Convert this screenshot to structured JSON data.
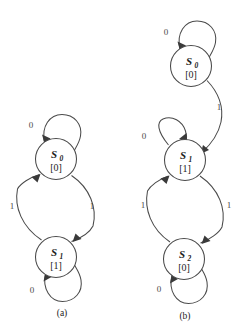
{
  "figure": {
    "type": "state-transition-diagrams",
    "background_color": "#ffffff",
    "line_color": "#4a4a4a",
    "text_color": "#1c1c1c"
  },
  "diagram_a": {
    "caption": "(a)",
    "caption_x": 62,
    "caption_y": 316,
    "states": [
      {
        "id": "a-s0",
        "name": "S",
        "subscript": "0",
        "output": "[0]",
        "cx": 56,
        "cy": 159,
        "r": 20.5
      },
      {
        "id": "a-s1",
        "name": "S",
        "subscript": "1",
        "output": "[1]",
        "cx": 56,
        "cy": 257,
        "r": 20.5
      }
    ],
    "transitions": [
      {
        "id": "a-s0-self",
        "from": "a-s0",
        "to": "a-s0",
        "label": "0",
        "label_x": 31,
        "label_y": 128
      },
      {
        "id": "a-s0-to-s1",
        "from": "a-s0",
        "to": "a-s1",
        "label": "1",
        "label_x": 12,
        "label_y": 209
      },
      {
        "id": "a-s1-to-s0",
        "from": "a-s1",
        "to": "a-s0",
        "label": "1",
        "label_x": 92,
        "label_y": 209
      },
      {
        "id": "a-s1-self",
        "from": "a-s1",
        "to": "a-s1",
        "label": "0",
        "label_x": 32,
        "label_y": 293
      }
    ]
  },
  "diagram_b": {
    "caption": "(b)",
    "caption_x": 185,
    "caption_y": 319,
    "states": [
      {
        "id": "b-s0",
        "name": "S",
        "subscript": "0",
        "output": "[0]",
        "cx": 191,
        "cy": 66,
        "r": 20.5
      },
      {
        "id": "b-s1",
        "name": "S",
        "subscript": "1",
        "output": "[1]",
        "cx": 185,
        "cy": 160,
        "r": 20.5
      },
      {
        "id": "b-s2",
        "name": "S",
        "subscript": "2",
        "output": "[0]",
        "cx": 184,
        "cy": 259,
        "r": 20.5
      }
    ],
    "transitions": [
      {
        "id": "b-s0-self",
        "from": "b-s0",
        "to": "b-s0",
        "label": "0",
        "label_x": 166,
        "label_y": 35
      },
      {
        "id": "b-s0-to-s1",
        "from": "b-s0",
        "to": "b-s1",
        "label": "1",
        "label_x": 219,
        "label_y": 110
      },
      {
        "id": "b-s1-self",
        "from": "b-s1",
        "to": "b-s1",
        "label": "0",
        "label_x": 144,
        "label_y": 139
      },
      {
        "id": "b-s1-to-s2",
        "from": "b-s1",
        "to": "b-s2",
        "label": "1",
        "label_x": 143,
        "label_y": 208
      },
      {
        "id": "b-s2-to-s1",
        "from": "b-s2",
        "to": "b-s1",
        "label": "1",
        "label_x": 229,
        "label_y": 208
      },
      {
        "id": "b-s2-self",
        "from": "b-s2",
        "to": "b-s2",
        "label": "0",
        "label_x": 159,
        "label_y": 292
      }
    ]
  }
}
